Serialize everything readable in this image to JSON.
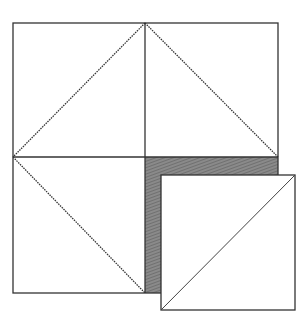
{
  "diagram": {
    "colors": {
      "background": "#ffffff",
      "stroke": "#333333",
      "shaded": "#7a7a7a"
    },
    "big_square": {
      "x": 13,
      "y": 23,
      "size": 265
    },
    "center": {
      "x": 145,
      "y": 157
    },
    "diamond_edges": [
      {
        "x1": 145,
        "y1": 23,
        "x2": 13,
        "y2": 157,
        "style": "dotted"
      },
      {
        "x1": 145,
        "y1": 23,
        "x2": 278,
        "y2": 157,
        "style": "dotted"
      },
      {
        "x1": 13,
        "y1": 157,
        "x2": 145,
        "y2": 293,
        "style": "dotted"
      }
    ],
    "shaded_region": {
      "x": 145,
      "y": 157,
      "width": 133,
      "height": 136
    },
    "small_square": {
      "x": 161,
      "y": 175,
      "size": 134
    },
    "small_square_diagonal": {
      "x1": 161,
      "y1": 309,
      "x2": 295,
      "y2": 175
    }
  }
}
